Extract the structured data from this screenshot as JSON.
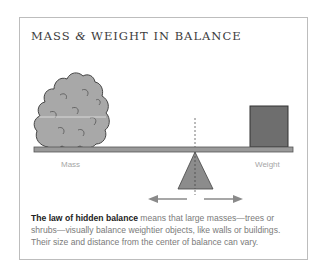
{
  "title": {
    "part1": "MASS ",
    "amp": "&",
    "part2": " WEIGHT IN BALANCE"
  },
  "labels": {
    "mass": "Mass",
    "weight": "Weight"
  },
  "caption": {
    "bold": "The law of hidden balance",
    "rest": " means that large masses—trees or shrubs—visually balance weightier objects, like walls or buildings. Their size and distance from the center of balance can vary."
  },
  "colors": {
    "tree_fill": "#a8a8a8",
    "box_fill": "#6e6e6e",
    "beam_fill": "#9a9a9a",
    "fulcrum_fill": "#8c8c8c",
    "outline": "#444444",
    "arrow": "#8a8a8a"
  },
  "icons": {
    "tree": "tree-shrub-icon",
    "box": "weight-box-icon",
    "fulcrum": "fulcrum-triangle-icon",
    "arrows": "left-right-arrows-icon"
  }
}
